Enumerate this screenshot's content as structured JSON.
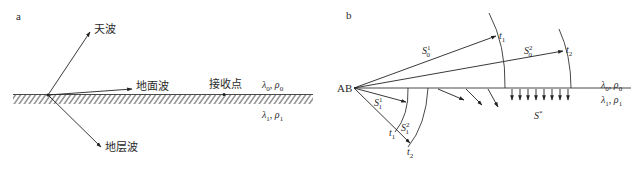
{
  "panel_a": {
    "letter": "a",
    "labels": {
      "sky_wave": "天波",
      "ground_wave": "地面波",
      "receiver": "接收点",
      "stratum_wave": "地层波"
    },
    "upper_medium": {
      "lambda": "λ",
      "lambda_sub": "0",
      "rho": "ρ",
      "rho_sub": "0",
      "sep": ", "
    },
    "lower_medium": {
      "lambda": "λ",
      "lambda_sub": "1",
      "rho": "ρ",
      "rho_sub": "1",
      "sep": ", "
    }
  },
  "panel_b": {
    "letter": "b",
    "source": "AB",
    "upper_medium": {
      "lambda": "λ",
      "lambda_sub": "0",
      "rho": "ρ",
      "rho_sub": "0",
      "sep": ", "
    },
    "lower_medium": {
      "lambda": "λ",
      "lambda_sub": "1",
      "rho": "ρ",
      "rho_sub": "1",
      "sep": ", "
    },
    "rays": {
      "s0_1": {
        "base": "S",
        "sub": "0",
        "sup": "1"
      },
      "s0_2": {
        "base": "S",
        "sub": "0",
        "sup": "2"
      },
      "s1_1": {
        "base": "S",
        "sub": "1",
        "sup": "1"
      },
      "s1_2": {
        "base": "S",
        "sub": "1",
        "sup": "2"
      },
      "s_star": {
        "base": "S",
        "sup": "*"
      }
    },
    "times": {
      "upper_t1": {
        "base": "t",
        "sub": "1"
      },
      "upper_t2": {
        "base": "t",
        "sub": "2"
      },
      "lower_t1": {
        "base": "t",
        "sub": "1"
      },
      "lower_t2": {
        "base": "t",
        "sub": "2"
      }
    }
  }
}
